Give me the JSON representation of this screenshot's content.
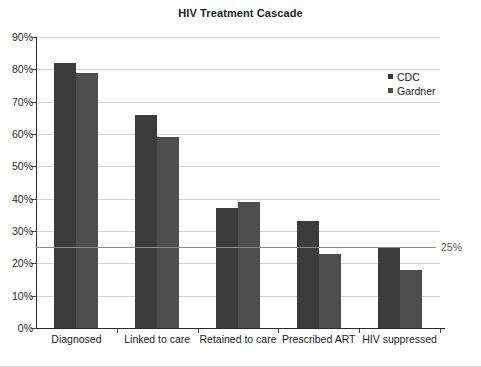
{
  "chart_data": {
    "type": "bar",
    "title": "HIV Treatment Cascade",
    "xlabel": "",
    "ylabel": "",
    "ylim": [
      0,
      90
    ],
    "ytick_labels": [
      "0%",
      "10%",
      "20%",
      "30%",
      "40%",
      "50%",
      "60%",
      "70%",
      "80%",
      "90%"
    ],
    "ytick_values": [
      0,
      10,
      20,
      30,
      40,
      50,
      60,
      70,
      80,
      90
    ],
    "grid": true,
    "legend_position": "top-right",
    "categories": [
      "Diagnosed",
      "Linked to care",
      "Retained to care",
      "Prescribed ART",
      "HIV suppressed"
    ],
    "series": [
      {
        "name": "CDC",
        "color": "#3b3b3b",
        "values": [
          82,
          66,
          37,
          33,
          25
        ]
      },
      {
        "name": "Gardner",
        "color": "#4e4e4e",
        "values": [
          79,
          59,
          39,
          23,
          18
        ]
      }
    ],
    "annotations": [
      {
        "name": "reference-line-25",
        "value": 25,
        "label": "25%",
        "orientation": "horizontal"
      }
    ]
  },
  "legend": {
    "items": [
      {
        "label": "CDC"
      },
      {
        "label": "Gardner"
      }
    ]
  }
}
